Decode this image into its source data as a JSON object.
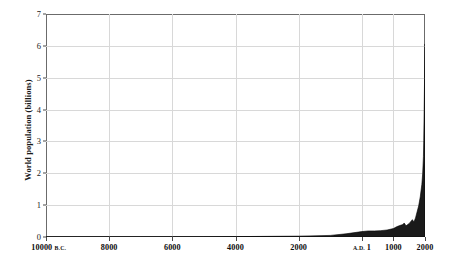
{
  "chart_data": {
    "type": "area",
    "title": "",
    "subtitle": "",
    "xlabel": "",
    "ylabel": "World population (billions)",
    "xlim": [
      -10000,
      2000
    ],
    "ylim": [
      0,
      7
    ],
    "grid": true,
    "legend": null,
    "fill_color": "#1a1a1a",
    "line_color": "#000000",
    "grid_color": "#d8d8d8",
    "frame_color": "#6b6b6b",
    "background": "#ffffff",
    "y_ticks": [
      0,
      1,
      2,
      3,
      4,
      5,
      6,
      7
    ],
    "y_tick_labels": [
      "0",
      "1",
      "2",
      "3",
      "4",
      "5",
      "6",
      "7"
    ],
    "x_ticks": [
      -10000,
      -8000,
      -6000,
      -4000,
      -2000,
      1,
      1000,
      2000
    ],
    "x_tick_labels": [
      {
        "number": "10000",
        "era": "B.C."
      },
      {
        "number": "8000",
        "era": ""
      },
      {
        "number": "6000",
        "era": ""
      },
      {
        "number": "4000",
        "era": ""
      },
      {
        "number": "2000",
        "era": ""
      },
      {
        "number": "1",
        "era": "A.D.",
        "era_before": true
      },
      {
        "number": "1000",
        "era": ""
      },
      {
        "number": "2000",
        "era": ""
      }
    ],
    "x": [
      -10000,
      -9000,
      -8000,
      -7000,
      -6000,
      -5000,
      -4000,
      -3000,
      -2000,
      -1000,
      -500,
      1,
      200,
      400,
      600,
      800,
      1000,
      1100,
      1200,
      1300,
      1340,
      1400,
      1500,
      1600,
      1650,
      1700,
      1750,
      1800,
      1850,
      1900,
      1927,
      1950,
      1960,
      1974,
      1987,
      1999,
      2000
    ],
    "values": [
      0.004,
      0.004,
      0.005,
      0.005,
      0.007,
      0.009,
      0.012,
      0.02,
      0.027,
      0.05,
      0.1,
      0.17,
      0.19,
      0.19,
      0.2,
      0.22,
      0.265,
      0.32,
      0.36,
      0.39,
      0.44,
      0.35,
      0.425,
      0.545,
      0.47,
      0.6,
      0.79,
      0.98,
      1.26,
      1.65,
      2.0,
      2.52,
      3.02,
      4.0,
      5.0,
      6.0,
      6.06
    ]
  }
}
